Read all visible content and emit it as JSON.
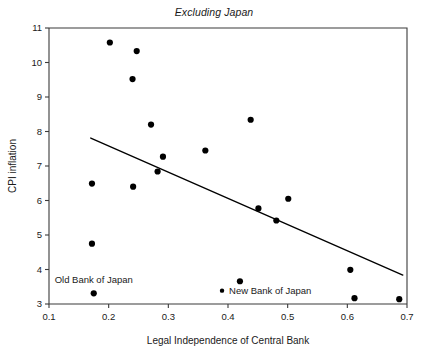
{
  "chart_data": {
    "type": "scatter",
    "title": "Excluding Japan",
    "xlabel": "Legal Independence of Central Bank",
    "ylabel": "CPI inflation",
    "xlim": [
      0.1,
      0.7
    ],
    "ylim": [
      3,
      11
    ],
    "xticks": [
      "0.1",
      "0.2",
      "0.3",
      "0.4",
      "0.5",
      "0.6",
      "0.7"
    ],
    "xtick_values": [
      0.1,
      0.2,
      0.3,
      0.4,
      0.5,
      0.6,
      0.7
    ],
    "yticks": [
      "3",
      "4",
      "5",
      "6",
      "7",
      "8",
      "9",
      "10",
      "11"
    ],
    "ytick_values": [
      3,
      4,
      5,
      6,
      7,
      8,
      9,
      10,
      11
    ],
    "grid": false,
    "legend": "none",
    "points": [
      {
        "x": 0.202,
        "y": 10.58
      },
      {
        "x": 0.247,
        "y": 10.33
      },
      {
        "x": 0.24,
        "y": 9.52
      },
      {
        "x": 0.271,
        "y": 8.2
      },
      {
        "x": 0.438,
        "y": 8.34
      },
      {
        "x": 0.362,
        "y": 7.45
      },
      {
        "x": 0.291,
        "y": 7.27
      },
      {
        "x": 0.282,
        "y": 6.84
      },
      {
        "x": 0.172,
        "y": 6.49
      },
      {
        "x": 0.241,
        "y": 6.4
      },
      {
        "x": 0.501,
        "y": 6.05
      },
      {
        "x": 0.451,
        "y": 5.77
      },
      {
        "x": 0.481,
        "y": 5.42
      },
      {
        "x": 0.172,
        "y": 4.75
      },
      {
        "x": 0.605,
        "y": 3.99
      },
      {
        "x": 0.42,
        "y": 3.66
      },
      {
        "x": 0.175,
        "y": 3.31
      },
      {
        "x": 0.612,
        "y": 3.17
      },
      {
        "x": 0.687,
        "y": 3.14
      }
    ],
    "fit_line": {
      "x0": 0.17,
      "y0": 7.81,
      "x1": 0.693,
      "y1": 3.84
    },
    "annotations": [
      {
        "label": "Old Bank of Japan",
        "x": 0.175,
        "y": 3.62,
        "marker": false
      },
      {
        "label": "New Bank of Japan",
        "x": 0.395,
        "y": 3.3,
        "marker": true
      }
    ]
  }
}
